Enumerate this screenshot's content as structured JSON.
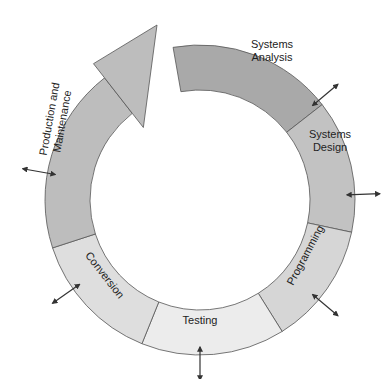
{
  "diagram": {
    "type": "cycle",
    "title": "",
    "colors": {
      "analysis": "#a9a9a9",
      "design": "#c2c2c2",
      "programming": "#d6d6d6",
      "testing": "#ececec",
      "conversion": "#dedede",
      "maintenance": "#bdbdbd",
      "stroke": "#555555",
      "arrow": "#333333"
    },
    "stages": [
      {
        "id": "analysis",
        "line1": "Systems",
        "line2": "Analysis"
      },
      {
        "id": "design",
        "line1": "Systems",
        "line2": "Design"
      },
      {
        "id": "programming",
        "line1": "Programming",
        "line2": ""
      },
      {
        "id": "testing",
        "line1": "Testing",
        "line2": ""
      },
      {
        "id": "conversion",
        "line1": "Conversion",
        "line2": ""
      },
      {
        "id": "maintenance",
        "line1": "Production and",
        "line2": "Maintenance"
      }
    ]
  }
}
